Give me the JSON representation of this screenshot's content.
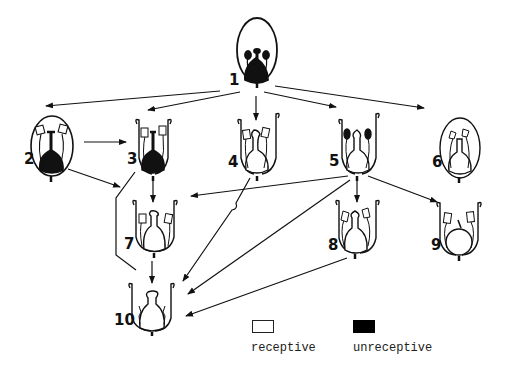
{
  "diagram": {
    "type": "flower developmental stage transition diagram",
    "stages": [
      {
        "id": 1,
        "label": "1",
        "enclosed": true,
        "pistil": "unreceptive",
        "anthers": "unreceptive"
      },
      {
        "id": 2,
        "label": "2",
        "enclosed": true,
        "pistil": "unreceptive",
        "anthers": "receptive"
      },
      {
        "id": 3,
        "label": "3",
        "enclosed": false,
        "pistil": "unreceptive",
        "anthers": "receptive"
      },
      {
        "id": 4,
        "label": "4",
        "enclosed": false,
        "pistil": "receptive",
        "anthers": "receptive"
      },
      {
        "id": 5,
        "label": "5",
        "enclosed": false,
        "pistil": "receptive",
        "anthers": "unreceptive"
      },
      {
        "id": 6,
        "label": "6",
        "enclosed": true,
        "pistil": "receptive",
        "anthers": "receptive"
      },
      {
        "id": 7,
        "label": "7",
        "enclosed": false,
        "pistil": "receptive",
        "anthers": "receptive"
      },
      {
        "id": 8,
        "label": "8",
        "enclosed": false,
        "pistil": "receptive",
        "anthers": "receptive"
      },
      {
        "id": 9,
        "label": "9",
        "enclosed": false,
        "pistil": "receptive",
        "anthers": "receptive"
      },
      {
        "id": 10,
        "label": "10",
        "enclosed": false,
        "pistil": "receptive",
        "anthers": "withered"
      }
    ],
    "edges": [
      {
        "from": 1,
        "to": 2
      },
      {
        "from": 1,
        "to": 3
      },
      {
        "from": 1,
        "to": 4
      },
      {
        "from": 1,
        "to": 5
      },
      {
        "from": 1,
        "to": 6
      },
      {
        "from": 2,
        "to": 3
      },
      {
        "from": 2,
        "to": 7
      },
      {
        "from": 3,
        "to": 7
      },
      {
        "from": 3,
        "to": 10
      },
      {
        "from": 4,
        "to": 10
      },
      {
        "from": 5,
        "to": 7
      },
      {
        "from": 5,
        "to": 8
      },
      {
        "from": 5,
        "to": 9
      },
      {
        "from": 5,
        "to": 10
      },
      {
        "from": 7,
        "to": 10
      },
      {
        "from": 8,
        "to": 10
      }
    ]
  },
  "legend": {
    "receptive": {
      "label": "receptive",
      "color": "#ffffff"
    },
    "unreceptive": {
      "label": "unreceptive",
      "color": "#000000"
    }
  }
}
